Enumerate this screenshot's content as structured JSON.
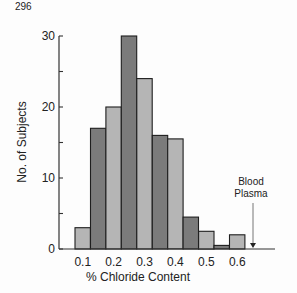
{
  "page_number": "296",
  "chart_data": {
    "type": "bar",
    "title": "",
    "xlabel": "% Chloride Content",
    "ylabel": "No. of Subjects",
    "ylim": [
      0,
      30
    ],
    "yticks": [
      0,
      10,
      20,
      30
    ],
    "xticks": [
      "0.1",
      "0.2",
      "0.3",
      "0.4",
      "0.5",
      "0.6"
    ],
    "grid": false,
    "legend": null,
    "bin_width": 0.05,
    "categories": [
      "0.10",
      "0.15",
      "0.20",
      "0.25",
      "0.30",
      "0.35",
      "0.40",
      "0.45",
      "0.50",
      "0.55",
      "0.60"
    ],
    "values": [
      3,
      17,
      20,
      30,
      24,
      16,
      15.5,
      4.5,
      2.5,
      0.5,
      2
    ],
    "bar_colors": [
      "light",
      "dark",
      "light",
      "dark",
      "light",
      "dark",
      "light",
      "dark",
      "light",
      "dark",
      "light"
    ],
    "annotations": [
      {
        "text": "Blood Plasma",
        "lines": [
          "Blood",
          "Plasma"
        ],
        "x": 0.65,
        "arrow": "down to x-axis"
      }
    ]
  },
  "colors": {
    "dark_bar": "#7b7b7b",
    "light_bar": "#b5b5b5",
    "outline": "#1e1e1e",
    "axis": "#333333",
    "arrow": "#777777"
  }
}
